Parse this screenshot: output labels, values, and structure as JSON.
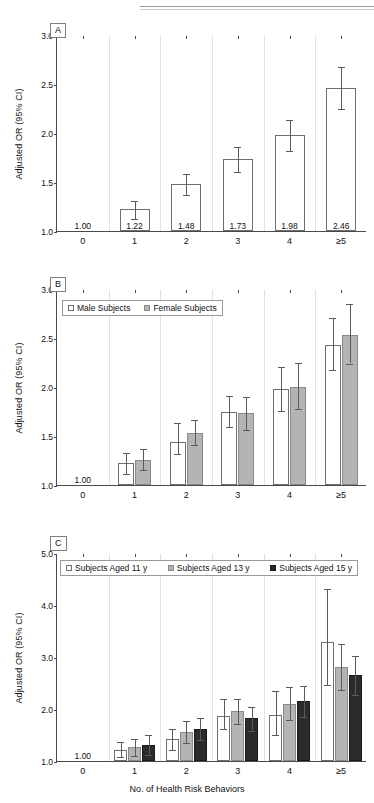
{
  "figure": {
    "xlabel": "No. of Health Risk Behaviors",
    "ylabel": "Adjusted OR (95% CI)",
    "categories": [
      "0",
      "1",
      "2",
      "3",
      "4",
      "≥5"
    ],
    "reference_label": "1.00"
  },
  "panels": {
    "a": {
      "label": "A"
    },
    "b": {
      "label": "B"
    },
    "c": {
      "label": "C"
    }
  },
  "legends": {
    "b": [
      {
        "label": "Male Subjects",
        "style": "white"
      },
      {
        "label": "Female Subjects",
        "style": "gray"
      }
    ],
    "c": [
      {
        "label": "Subjects Aged 11 y",
        "style": "white"
      },
      {
        "label": "Subjects Aged 13 y",
        "style": "gray"
      },
      {
        "label": "Subjects Aged 15 y",
        "style": "dark"
      }
    ]
  },
  "axis_ticks": {
    "ab": [
      "1.0",
      "1.5",
      "2.0",
      "2.5",
      "3.0"
    ],
    "c": [
      "1.0",
      "2.0",
      "3.0",
      "4.0",
      "5.0"
    ]
  },
  "chart_data": [
    {
      "type": "bar",
      "panel": "A",
      "title": "A",
      "xlabel": "No. of Health Risk Behaviors",
      "ylabel": "Adjusted OR (95% CI)",
      "ylim": [
        1.0,
        3.0
      ],
      "yticks": [
        1.0,
        1.5,
        2.0,
        2.5,
        3.0
      ],
      "grid": false,
      "legend": null,
      "categories": [
        "0",
        "1",
        "2",
        "3",
        "4",
        "≥5"
      ],
      "series": [
        {
          "name": "All Subjects",
          "style": "white",
          "values": [
            1.0,
            1.22,
            1.48,
            1.73,
            1.98,
            2.46
          ],
          "ci_low": [
            null,
            1.13,
            1.38,
            1.61,
            1.83,
            2.26
          ],
          "ci_high": [
            null,
            1.32,
            1.59,
            1.87,
            2.14,
            2.68
          ],
          "data_labels": [
            "1.00",
            "1.22",
            "1.48",
            "1.73",
            "1.98",
            "2.46"
          ]
        }
      ]
    },
    {
      "type": "bar",
      "panel": "B",
      "title": "B",
      "xlabel": "No. of Health Risk Behaviors",
      "ylabel": "Adjusted OR (95% CI)",
      "ylim": [
        1.0,
        3.0
      ],
      "yticks": [
        1.0,
        1.5,
        2.0,
        2.5,
        3.0
      ],
      "grid": false,
      "legend_position": "top-left",
      "categories": [
        "0",
        "1",
        "2",
        "3",
        "4",
        "≥5"
      ],
      "series": [
        {
          "name": "Male Subjects",
          "style": "white",
          "values": [
            1.0,
            1.22,
            1.44,
            1.75,
            1.98,
            2.43
          ],
          "ci_low": [
            null,
            1.12,
            1.33,
            1.6,
            1.77,
            2.18
          ],
          "ci_high": [
            null,
            1.34,
            1.64,
            1.92,
            2.21,
            2.71
          ],
          "data_labels": [
            "1.00",
            null,
            null,
            null,
            null,
            null
          ]
        },
        {
          "name": "Female Subjects",
          "style": "gray",
          "values": [
            null,
            1.26,
            1.53,
            1.73,
            2.0,
            2.53
          ],
          "ci_low": [
            null,
            1.16,
            1.42,
            1.57,
            1.79,
            2.25
          ],
          "ci_high": [
            null,
            1.38,
            1.67,
            1.91,
            2.26,
            2.86
          ],
          "data_labels": [
            null,
            null,
            null,
            null,
            null,
            null
          ]
        }
      ]
    },
    {
      "type": "bar",
      "panel": "C",
      "title": "C",
      "xlabel": "No. of Health Risk Behaviors",
      "ylabel": "Adjusted OR (95% CI)",
      "ylim": [
        1.0,
        5.0
      ],
      "yticks": [
        1.0,
        2.0,
        3.0,
        4.0,
        5.0
      ],
      "grid": false,
      "legend_position": "top",
      "categories": [
        "0",
        "1",
        "2",
        "3",
        "4",
        "≥5"
      ],
      "series": [
        {
          "name": "Subjects Aged 11 y",
          "style": "white",
          "values": [
            1.0,
            1.22,
            1.42,
            1.87,
            1.89,
            3.29
          ],
          "ci_low": [
            null,
            1.09,
            1.24,
            1.63,
            1.51,
            2.49
          ],
          "ci_high": [
            null,
            1.39,
            1.64,
            2.21,
            2.36,
            4.32
          ],
          "data_labels": [
            "1.00",
            null,
            null,
            null,
            null,
            null
          ]
        },
        {
          "name": "Subjects Aged 13 y",
          "style": "gray",
          "values": [
            null,
            1.27,
            1.55,
            1.96,
            2.1,
            2.81
          ],
          "ci_low": [
            null,
            1.12,
            1.37,
            1.73,
            1.8,
            2.38
          ],
          "ci_high": [
            null,
            1.44,
            1.79,
            2.21,
            2.44,
            3.27
          ],
          "data_labels": [
            null,
            null,
            null,
            null,
            null,
            null
          ]
        },
        {
          "name": "Subjects Aged 15 y",
          "style": "dark",
          "values": [
            null,
            1.3,
            1.62,
            1.82,
            2.15,
            2.65
          ],
          "ci_low": [
            null,
            1.13,
            1.43,
            1.59,
            1.87,
            2.29
          ],
          "ci_high": [
            null,
            1.51,
            1.85,
            2.06,
            2.46,
            3.03
          ],
          "data_labels": [
            null,
            null,
            null,
            null,
            null,
            null
          ]
        }
      ]
    }
  ]
}
